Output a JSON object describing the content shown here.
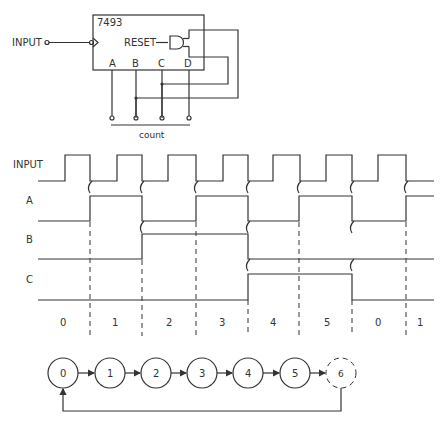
{
  "circuit": {
    "chip_label": "7493",
    "input_label": "INPUT",
    "reset_label": "RESET",
    "outputs": [
      "A",
      "B",
      "C",
      "D"
    ],
    "count_label": "count"
  },
  "timing": {
    "signals": [
      "INPUT",
      "A",
      "B",
      "C"
    ],
    "count_labels": [
      "0",
      "1",
      "2",
      "3",
      "4",
      "5",
      "0",
      "1"
    ]
  },
  "state_diagram": {
    "states": [
      "0",
      "1",
      "2",
      "3",
      "4",
      "5",
      "6"
    ],
    "transient_state": "6"
  },
  "colors": {
    "ink": "#333333",
    "background": "#ffffff"
  }
}
